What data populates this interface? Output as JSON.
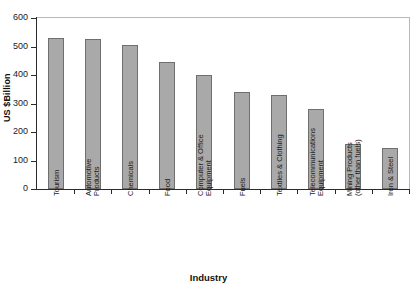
{
  "chart_data": {
    "type": "bar",
    "title": "",
    "xlabel": "Industry",
    "ylabel": "US $Billion",
    "ylim": [
      0,
      600
    ],
    "yticks": [
      0,
      100,
      200,
      300,
      400,
      500,
      600
    ],
    "grid": false,
    "legend": null,
    "orientation": "vertical",
    "bar_color": "#a9a9a9",
    "bar_edge_color": "#6f6f6f",
    "categories": [
      "Tourism",
      "Automotive Products",
      "Chemicals",
      "Food",
      "Computer & Office Equipment",
      "Fuels",
      "Textiles & Clothing",
      "Telecommunications Equipment",
      "Mining Products (other than fuels)",
      "Iron & Steel"
    ],
    "category_label_lines": [
      [
        "Tourism"
      ],
      [
        "Automotive",
        "Products"
      ],
      [
        "Chemicals"
      ],
      [
        "Food"
      ],
      [
        "Computer & Office",
        "Equipment"
      ],
      [
        "Fuels"
      ],
      [
        "Textiles & Clothing"
      ],
      [
        "Telecommunications",
        "Equipment"
      ],
      [
        "Mining Products",
        "(other than fuels)"
      ],
      [
        "Iron & Steel"
      ]
    ],
    "values": [
      530,
      525,
      505,
      445,
      400,
      340,
      330,
      282,
      157,
      143
    ]
  }
}
